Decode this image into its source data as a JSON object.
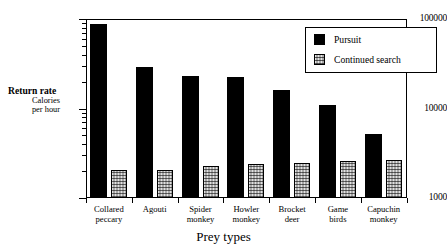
{
  "chart_data": {
    "type": "bar",
    "title": "",
    "xlabel": "Prey types",
    "ylabel": "Return rate",
    "ylabel_sub_line1": "Calories",
    "ylabel_sub_line2": "per hour",
    "yscale": "log",
    "ylim": [
      1000,
      100000
    ],
    "ytick_labels": [
      "100000",
      "10000",
      "1000"
    ],
    "ytick_values": [
      100000,
      10000,
      1000
    ],
    "grid": false,
    "legend_position": "top-right",
    "categories": [
      "Collared peccary",
      "Agouti",
      "Spider monkey",
      "Howler monkey",
      "Brocket deer",
      "Game birds",
      "Capuchin monkey"
    ],
    "category_lines": [
      [
        "Collared",
        "peccary"
      ],
      [
        "Agouti",
        ""
      ],
      [
        "Spider",
        "monkey"
      ],
      [
        "Howler",
        "monkey"
      ],
      [
        "Brocket",
        "deer"
      ],
      [
        "Game",
        "birds"
      ],
      [
        "Capuchin",
        "monkey"
      ]
    ],
    "series": [
      {
        "name": "Pursuit",
        "color": "#000000",
        "values": [
          88000,
          29000,
          23000,
          22500,
          16000,
          11000,
          5200
        ]
      },
      {
        "name": "Continued search",
        "color": "#a8a8a8",
        "values": [
          2050,
          2080,
          2250,
          2400,
          2450,
          2600,
          2650
        ]
      }
    ]
  },
  "legend": {
    "items": [
      {
        "label": "Pursuit",
        "swatch": "black"
      },
      {
        "label": "Continued search",
        "swatch": "stipple"
      }
    ]
  }
}
